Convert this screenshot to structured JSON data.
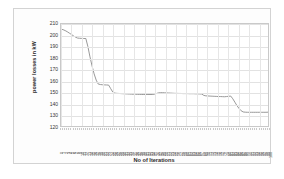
{
  "chart_data": {
    "type": "line",
    "title": "",
    "xlabel": "No of Iterations",
    "ylabel": "power losses in kW",
    "ylim": [
      120,
      210
    ],
    "xlim": [
      0,
      100
    ],
    "yticks": [
      210,
      200,
      190,
      180,
      170,
      160,
      150,
      140,
      130,
      120
    ],
    "grid": true,
    "legend": false,
    "series_color": "#8c8c8c",
    "x": [
      0,
      1,
      2,
      3,
      4,
      5,
      6,
      7,
      8,
      9,
      10,
      11,
      12,
      13,
      14,
      15,
      16,
      17,
      18,
      19,
      20,
      21,
      22,
      23,
      24,
      25,
      26,
      27,
      28,
      29,
      30,
      31,
      32,
      33,
      34,
      35,
      36,
      37,
      38,
      39,
      40,
      41,
      42,
      43,
      44,
      45,
      46,
      47,
      48,
      49,
      50,
      51,
      52,
      53,
      54,
      55,
      56,
      57,
      58,
      59,
      60,
      61,
      62,
      63,
      64,
      65,
      66,
      67,
      68,
      69,
      70,
      71,
      72,
      73,
      74,
      75,
      76,
      77,
      78,
      79,
      80,
      81,
      82,
      83,
      84,
      85,
      86,
      87,
      88,
      89,
      90,
      91,
      92,
      93,
      94,
      95,
      96,
      97,
      98,
      99,
      100
    ],
    "values": [
      205.5,
      205.0,
      204.2,
      203.2,
      202.0,
      200.8,
      199.6,
      198.4,
      197.6,
      197.4,
      197.3,
      197.2,
      197.2,
      190.0,
      181.0,
      173.0,
      166.0,
      160.5,
      157.0,
      156.6,
      156.4,
      156.3,
      156.2,
      156.1,
      153.0,
      150.0,
      149.0,
      148.8,
      148.7,
      148.6,
      148.5,
      148.4,
      148.3,
      148.2,
      148.1,
      148.0,
      148.0,
      147.9,
      147.9,
      147.8,
      147.8,
      147.8,
      147.8,
      147.8,
      147.8,
      148.0,
      148.6,
      149.2,
      149.4,
      149.4,
      149.3,
      149.2,
      149.1,
      149.0,
      148.9,
      148.8,
      148.8,
      148.7,
      148.7,
      148.6,
      148.6,
      148.6,
      148.5,
      148.5,
      148.5,
      148.4,
      148.4,
      148.3,
      148.2,
      147.0,
      146.6,
      146.5,
      146.4,
      146.3,
      146.2,
      146.1,
      146.0,
      146.0,
      145.9,
      145.8,
      146.0,
      146.2,
      146.4,
      144.0,
      141.0,
      138.0,
      135.5,
      133.5,
      132.4,
      132.2,
      132.1,
      132.1,
      132.1,
      132.1,
      132.1,
      132.1,
      132.1,
      132.1,
      132.1,
      132.1,
      132.2
    ],
    "xtick_labels": [
      "0",
      "1",
      "2",
      "3",
      "4",
      "5",
      "6",
      "7",
      "8",
      "9",
      "10",
      "11",
      "12",
      "13",
      "14",
      "15",
      "16",
      "17",
      "18",
      "19",
      "20",
      "21",
      "22",
      "23",
      "24",
      "25",
      "26",
      "27",
      "28",
      "29",
      "30",
      "31",
      "32",
      "33",
      "34",
      "35",
      "36",
      "37",
      "38",
      "39",
      "40",
      "41",
      "42",
      "43",
      "44",
      "45",
      "46",
      "47",
      "48",
      "49",
      "50",
      "51",
      "52",
      "53",
      "54",
      "55",
      "56",
      "57",
      "58",
      "59",
      "60",
      "61",
      "62",
      "63",
      "64",
      "65",
      "66",
      "67",
      "68",
      "69",
      "70",
      "71",
      "72",
      "73",
      "74",
      "75",
      "76",
      "77",
      "78",
      "79",
      "80",
      "81",
      "82",
      "83",
      "84",
      "85",
      "86",
      "87",
      "88",
      "89",
      "90",
      "91",
      "92",
      "93",
      "94",
      "95",
      "96",
      "97",
      "98",
      "99",
      "100"
    ]
  }
}
